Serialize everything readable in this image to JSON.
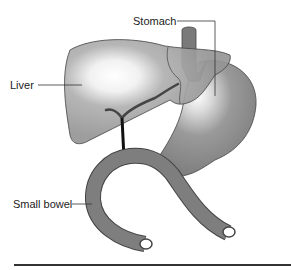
{
  "labels": {
    "stomach": "Stomach",
    "liver": "Liver",
    "small_bowel": "Small bowel"
  },
  "colors": {
    "liver_fill": "#9a9a9a",
    "stomach_fill": "#8a8a8a",
    "bowel_fill": "#7a7a7a",
    "outline": "#444444",
    "bile_duct": "#333333",
    "rule": "#333333"
  }
}
